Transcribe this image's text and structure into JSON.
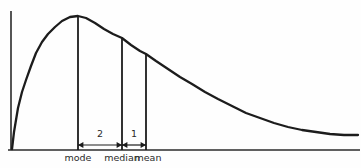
{
  "figure": {
    "title": "",
    "background_color": "#fefefe",
    "line_color": "#1c1c1c",
    "axis_color": "#2b2b2b"
  },
  "axes": {
    "y_axis_label": "",
    "x_axis_label": "",
    "y_axis": {
      "x": 11,
      "y_top": 11,
      "y_bottom": 150
    },
    "x_axis": {
      "y": 150,
      "x_left": 8,
      "x_right": 360
    }
  },
  "markers": [
    {
      "name": "mode",
      "label": "mode",
      "x": 78,
      "top_y": 16,
      "bottom_y": 150,
      "label_x": 78,
      "label_y": 161
    },
    {
      "name": "median",
      "label": "median",
      "x": 122,
      "top_y": 38,
      "bottom_y": 150,
      "label_x": 122,
      "label_y": 161
    },
    {
      "name": "mean",
      "label": "mean",
      "x": 146,
      "top_y": 54,
      "bottom_y": 150,
      "label_x": 148,
      "label_y": 161
    }
  ],
  "gaps": [
    {
      "name": "mode-to-median",
      "label": "2",
      "from": "mode",
      "to": "median",
      "x1": 78,
      "x2": 122,
      "arrow_y": 145,
      "label_x": 100,
      "label_y": 137
    },
    {
      "name": "median-to-mean",
      "label": "1",
      "from": "median",
      "to": "mean",
      "x1": 122,
      "x2": 146,
      "arrow_y": 145,
      "label_x": 134,
      "label_y": 137
    }
  ],
  "chart_data": {
    "type": "line",
    "title": "",
    "xlabel": "",
    "ylabel": "",
    "grid": false,
    "legend": "none",
    "xlim": [
      0,
      361
    ],
    "ylim": [
      0,
      168
    ],
    "annotations": [
      "mode",
      "median",
      "mean",
      "2",
      "1"
    ],
    "series": [
      {
        "name": "distribution-curve",
        "points": [
          [
            12,
            149
          ],
          [
            14,
            132
          ],
          [
            18,
            108
          ],
          [
            22,
            92
          ],
          [
            26,
            80
          ],
          [
            31,
            66
          ],
          [
            36,
            53
          ],
          [
            42,
            42
          ],
          [
            48,
            34
          ],
          [
            55,
            27
          ],
          [
            62,
            21
          ],
          [
            70,
            17
          ],
          [
            78,
            16
          ],
          [
            86,
            18
          ],
          [
            95,
            23
          ],
          [
            104,
            29
          ],
          [
            113,
            34
          ],
          [
            122,
            38
          ],
          [
            131,
            45
          ],
          [
            140,
            51
          ],
          [
            146,
            54
          ],
          [
            156,
            61
          ],
          [
            168,
            69
          ],
          [
            180,
            77
          ],
          [
            192,
            84
          ],
          [
            205,
            92
          ],
          [
            218,
            99
          ],
          [
            232,
            106
          ],
          [
            246,
            113
          ],
          [
            260,
            118
          ],
          [
            274,
            123
          ],
          [
            288,
            127
          ],
          [
            302,
            130
          ],
          [
            316,
            132
          ],
          [
            330,
            134
          ],
          [
            344,
            135
          ],
          [
            358,
            135
          ]
        ]
      }
    ],
    "marker_values": {
      "mode": 78,
      "median": 122,
      "mean": 146,
      "mode_to_median_gap": 2,
      "median_to_mean_gap": 1
    }
  }
}
